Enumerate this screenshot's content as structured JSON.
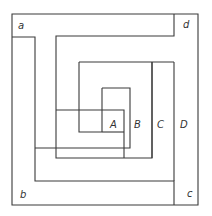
{
  "diagram": {
    "type": "nested spiral / maze of corridors",
    "labels": {
      "a": "a",
      "b": "b",
      "c": "c",
      "d": "d",
      "A": "A",
      "B": "B",
      "C": "C",
      "D": "D"
    },
    "colors": {
      "line": "#3a3a3a",
      "background": "#ffffff",
      "text": "#333333"
    }
  }
}
